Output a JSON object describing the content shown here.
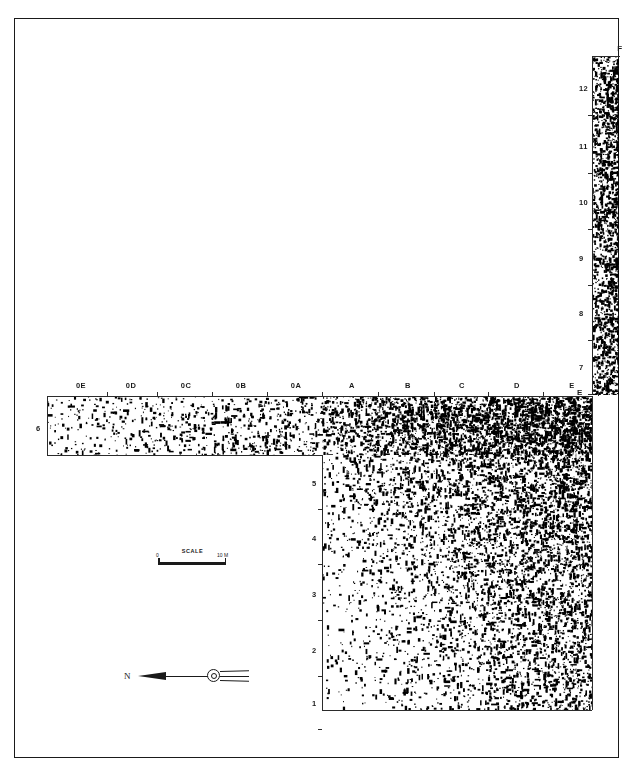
{
  "figure": {
    "kind": "archaeological-site-plan",
    "background_color": "#ffffff",
    "ink_color": "#1a1a1a"
  },
  "frame": {
    "x": 14,
    "y": 18,
    "width": 605,
    "height": 740
  },
  "grid": {
    "column_labels": [
      "0E",
      "0D",
      "0C",
      "0B",
      "0A",
      "A",
      "B",
      "C",
      "D",
      "E"
    ],
    "column_x": [
      81,
      131,
      186,
      241,
      296,
      352,
      408,
      462,
      517,
      572
    ],
    "header_y": 381,
    "f_label": "F",
    "f_label_x": 620,
    "f_label_y": 44,
    "row_labels_left": [
      "6"
    ],
    "row_left_y": [
      428
    ],
    "row_left_x": 36,
    "row_labels_inner": [
      "5",
      "4",
      "3",
      "2",
      "1"
    ],
    "row_inner_y": [
      483,
      538,
      594,
      650,
      703
    ],
    "row_inner_x": 312,
    "row_labels_f": [
      "12",
      "11",
      "10",
      "9",
      "8",
      "7"
    ],
    "row_f_y": [
      88,
      146,
      202,
      258,
      313,
      367
    ],
    "row_f_x": 579,
    "corner_label_e": "E",
    "corner_e_x": 577,
    "corner_e_y": 392
  },
  "areas": {
    "f_column": {
      "x": 592,
      "y": 56,
      "width": 27,
      "height": 339
    },
    "horizontal_trench": {
      "x": 47,
      "y": 396,
      "width": 545,
      "height": 59
    },
    "main_block": {
      "x": 322,
      "y": 396,
      "width": 270,
      "height": 314
    }
  },
  "scale_bar": {
    "title": "SCALE",
    "min_label": "0",
    "max_label": "10 M"
  },
  "north_arrow": {
    "label": "N"
  }
}
